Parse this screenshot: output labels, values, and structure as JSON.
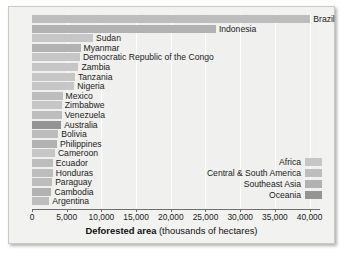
{
  "chart_data": {
    "type": "bar",
    "orientation": "horizontal",
    "title": "",
    "xlabel_bold": "Deforested area",
    "xlabel_rest": "(thousands of hectares)",
    "ylabel": "",
    "xlim": [
      0,
      41500
    ],
    "xticks": [
      0,
      5000,
      10000,
      15000,
      20000,
      25000,
      30000,
      35000,
      40000
    ],
    "xticklabels": [
      "0",
      "5,000",
      "10,000",
      "15,000",
      "20,000",
      "25,000",
      "30,000",
      "35,000",
      "40,000"
    ],
    "grid": true,
    "grid_axis": "x",
    "legend_position": "inside-center-right",
    "categories": [
      "Brazil",
      "Indonesia",
      "Sudan",
      "Myanmar",
      "Democratic Republic of the Congo",
      "Zambia",
      "Tanzania",
      "Nigeria",
      "Mexico",
      "Zimbabwe",
      "Venezuela",
      "Australia",
      "Bolivia",
      "Philippines",
      "Cameroon",
      "Ecuador",
      "Honduras",
      "Paraguay",
      "Cambodia",
      "Argentina"
    ],
    "values": [
      40100,
      26500,
      8800,
      7000,
      6900,
      6700,
      6200,
      6100,
      4400,
      4300,
      4300,
      4200,
      3800,
      3600,
      3300,
      3000,
      3000,
      2900,
      2800,
      2500
    ],
    "regions": [
      "Central & South America",
      "Southeast Asia",
      "Africa",
      "Southeast Asia",
      "Africa",
      "Africa",
      "Africa",
      "Africa",
      "Central & South America",
      "Africa",
      "Central & South America",
      "Oceania",
      "Central & South America",
      "Southeast Asia",
      "Africa",
      "Central & South America",
      "Central & South America",
      "Central & South America",
      "Southeast Asia",
      "Central & South America"
    ],
    "series": [
      {
        "name": "Africa",
        "color": "#c6c6c6"
      },
      {
        "name": "Central & South America",
        "color": "#bdbdbd"
      },
      {
        "name": "Southeast Asia",
        "color": "#b2b2b2"
      },
      {
        "name": "Oceania",
        "color": "#949494"
      }
    ]
  },
  "legend": {
    "items": [
      {
        "label": "Africa",
        "color": "#c6c6c6"
      },
      {
        "label": "Central & South America",
        "color": "#bdbdbd"
      },
      {
        "label": "Southeast Asia",
        "color": "#b2b2b2"
      },
      {
        "label": "Oceania",
        "color": "#949494"
      }
    ]
  },
  "colors": {
    "figure_background": "#f2f2f0",
    "plot_background": "#f0f0ee",
    "gridline": "#ffffff",
    "axis": "#6e6e6e",
    "text": "#1b1b1b"
  }
}
